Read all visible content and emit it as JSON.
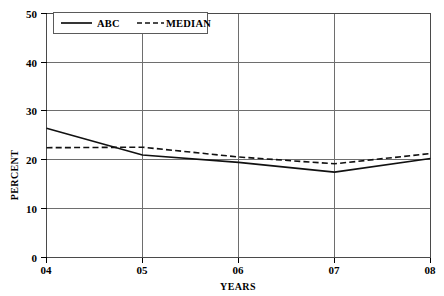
{
  "chart_data": {
    "type": "line",
    "title": "",
    "xlabel": "YEARS",
    "ylabel": "PERCENT",
    "x": [
      "04",
      "05",
      "06",
      "07",
      "08"
    ],
    "categories": [
      "04",
      "05",
      "06",
      "07",
      "08"
    ],
    "xlim": [
      0,
      4
    ],
    "ylim": [
      0,
      50
    ],
    "y_ticks": [
      0,
      10,
      20,
      30,
      40,
      50
    ],
    "y_tick_labels": [
      "0",
      "10",
      "20",
      "30",
      "40",
      "50"
    ],
    "x_tick_labels": [
      "04",
      "05",
      "06",
      "07",
      "08"
    ],
    "grid": "horizontal-and-vertical",
    "legend_position": "top-left-inside",
    "series": [
      {
        "name": "ABC",
        "style": "solid",
        "color": "#111111",
        "values": [
          26.5,
          21.0,
          19.5,
          17.5,
          20.3
        ]
      },
      {
        "name": "MEDIAN",
        "style": "dashed",
        "color": "#111111",
        "values": [
          22.5,
          22.6,
          20.6,
          19.2,
          21.3
        ]
      }
    ]
  },
  "legend": {
    "entries": [
      {
        "label": "ABC",
        "style": "solid"
      },
      {
        "label": "MEDIAN",
        "style": "dashed"
      }
    ]
  },
  "axes": {
    "y_title": "PERCENT",
    "x_title": "YEARS",
    "y_labels": [
      "50",
      "40",
      "30",
      "20",
      "10",
      "0"
    ],
    "x_labels": [
      "04",
      "05",
      "06",
      "07",
      "08"
    ]
  },
  "colors": {
    "line": "#111111",
    "grid": "#6e6e6e",
    "frame": "#4a4a4a",
    "background": "#ffffff",
    "text": "#000000"
  }
}
